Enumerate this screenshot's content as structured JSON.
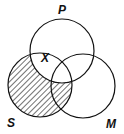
{
  "diagram": {
    "type": "venn",
    "sets": [
      {
        "label": "P",
        "cx": 62,
        "cy": 51,
        "r": 32
      },
      {
        "label": "S",
        "cx": 40,
        "cy": 85,
        "r": 32
      },
      {
        "label": "M",
        "cx": 83,
        "cy": 86,
        "r": 32
      }
    ],
    "shaded_region": "S minus P",
    "mark": {
      "symbol": "X",
      "region": "S and P boundary"
    },
    "labels": {
      "P": "P",
      "S": "S",
      "M": "M",
      "X": "X"
    },
    "stroke_color": "#111111",
    "background": "#ffffff"
  }
}
